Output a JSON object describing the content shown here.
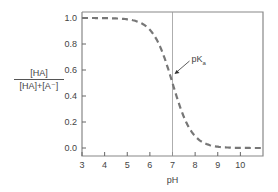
{
  "chart_data": {
    "type": "line",
    "title": "",
    "xlabel": "pH",
    "ylabel": "[HA] / ([HA]+[A⁻])",
    "ylabel_numerator": "[HA]",
    "ylabel_denominator": "[HA]+[A⁻]",
    "xlim": [
      3,
      11
    ],
    "ylim": [
      -0.05,
      1.05
    ],
    "x_ticks": [
      3,
      4,
      5,
      6,
      7,
      8,
      9,
      10
    ],
    "y_ticks": [
      "0.0",
      "0.2",
      "0.4",
      "0.6",
      "0.8",
      "1.0"
    ],
    "grid": false,
    "series": [
      {
        "name": "fraction protonated",
        "style": "dashed",
        "color": "#777777",
        "x": [
          3,
          4,
          5,
          5.5,
          6,
          6.5,
          7,
          7.5,
          8,
          8.5,
          9,
          10,
          11
        ],
        "values": [
          1.0,
          1.0,
          0.99,
          0.97,
          0.91,
          0.76,
          0.5,
          0.24,
          0.09,
          0.03,
          0.01,
          0.0,
          0.0
        ]
      }
    ],
    "annotations": [
      {
        "text": "pK",
        "subscript": "a",
        "x": 7,
        "y": 0.5,
        "type": "arrow"
      },
      {
        "type": "vline",
        "x": 7
      }
    ]
  }
}
